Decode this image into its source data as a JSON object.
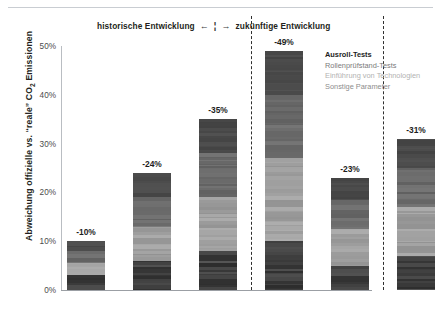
{
  "header": {
    "left_text": "historische Entwicklung",
    "arrow_left": "←",
    "mid_bar": "¦",
    "arrow_right": "→",
    "right_text": "zukünftige Entwicklung"
  },
  "axis": {
    "y_title_pre": "Abweichung offizielle vs. “reale” CO",
    "y_title_sub": "2",
    "y_title_post": " Emissionen"
  },
  "legend": {
    "items": [
      {
        "label": "Ausroll-Tests",
        "color": "#3f3f3f"
      },
      {
        "label": "Rollenprüfstand-Tests",
        "color": "#7b7b7b"
      },
      {
        "label": "Einführung von Technologien",
        "color": "#b2b2b2"
      },
      {
        "label": "Sonstige Parameter",
        "color": "#8d8d8d"
      }
    ]
  },
  "chart_data": {
    "type": "bar",
    "title": "",
    "subtitle": "",
    "xlabel": "",
    "ylabel": "Abweichung offizielle vs. “reale” CO2 Emissionen",
    "ylim": [
      0,
      50
    ],
    "grid": false,
    "legend_position": "right",
    "stacked": true,
    "y_ticks": [
      "0%",
      "10%",
      "20%",
      "30%",
      "40%",
      "50%"
    ],
    "y_tick_values": [
      0,
      10,
      20,
      30,
      40,
      50
    ],
    "categories": [
      {
        "year": "2002",
        "cycle": "NEDC"
      },
      {
        "year": "2010",
        "cycle": "NEDC"
      },
      {
        "year": "2014",
        "cycle": "NEDC"
      },
      {
        "year": "2020",
        "cycle": "NEDC"
      },
      {
        "year": "2020",
        "cycle": "WLTP"
      },
      {
        "year": "2025",
        "cycle": "WLTP"
      }
    ],
    "values": [
      10,
      24,
      35,
      49,
      23,
      31
    ],
    "data_labels": [
      "-10%",
      "-24%",
      "-35%",
      "-49%",
      "-23%",
      "-31%"
    ],
    "series": [
      {
        "name": "Ausroll-Tests",
        "values": [
          2.0,
          5.0,
          7.0,
          9.0,
          4.5,
          6.0
        ]
      },
      {
        "name": "Rollenprüfstand-Tests",
        "values": [
          2.5,
          6.0,
          9.0,
          13.0,
          6.0,
          8.0
        ]
      },
      {
        "name": "Einführung von Technologien",
        "values": [
          2.5,
          7.0,
          11.0,
          17.0,
          7.5,
          10.0
        ]
      },
      {
        "name": "Sonstige Parameter",
        "values": [
          3.0,
          6.0,
          8.0,
          10.0,
          5.0,
          7.0
        ]
      }
    ],
    "annotations": [
      "historische Entwicklung",
      "zukünftige Entwicklung"
    ]
  }
}
